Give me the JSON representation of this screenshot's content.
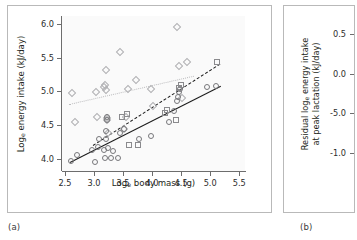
{
  "figure": {
    "panels": [
      {
        "id": "a",
        "caption": "(a)"
      },
      {
        "id": "b",
        "caption": "(b)"
      }
    ]
  },
  "chart_data": [
    {
      "type": "scatter",
      "panel": "(a)",
      "title": "",
      "xlabel_prefix": "Log",
      "xlabel_sub": "e",
      "xlabel_suffix": " body mass (g)",
      "xlabel": "Log_e body mass (g)",
      "ylabel_prefix": "Log",
      "ylabel_sub": "e",
      "ylabel_suffix": " energy intake (kJ/day)",
      "ylabel": "Log_e energy intake (kJ/day)",
      "xlim": [
        2.45,
        5.6
      ],
      "ylim": [
        3.82,
        6.12
      ],
      "xticks": [
        "2.5",
        "3.0",
        "3.5",
        "4.0",
        "4.5",
        "5.0",
        "5.5"
      ],
      "xtick_values": [
        2.5,
        3.0,
        3.5,
        4.0,
        4.5,
        5.0,
        5.5
      ],
      "yticks": [
        "6.0",
        "5.5",
        "5.0",
        "4.5",
        "4.0"
      ],
      "ytick_values": [
        6.0,
        5.5,
        5.0,
        4.5,
        4.0
      ],
      "grid": false,
      "legend": "none",
      "series": [
        {
          "name": "diamond-series",
          "marker": "diamond",
          "color": "#b0b0b3",
          "points": [
            [
              2.62,
              4.98
            ],
            [
              2.67,
              4.55
            ],
            [
              3.03,
              4.99
            ],
            [
              3.05,
              4.62
            ],
            [
              3.17,
              5.06
            ],
            [
              3.19,
              5.1
            ],
            [
              3.2,
              5.02
            ],
            [
              3.2,
              5.32
            ],
            [
              3.22,
              4.61
            ],
            [
              3.22,
              4.57
            ],
            [
              3.24,
              4.39
            ],
            [
              3.45,
              5.58
            ],
            [
              3.52,
              4.44
            ],
            [
              3.55,
              4.62
            ],
            [
              3.58,
              5.04
            ],
            [
              3.72,
              5.17
            ],
            [
              3.98,
              5.03
            ],
            [
              4.02,
              4.78
            ],
            [
              4.43,
              5.96
            ],
            [
              4.47,
              5.38
            ],
            [
              4.52,
              4.9
            ],
            [
              4.6,
              5.44
            ]
          ]
        },
        {
          "name": "circle-series",
          "marker": "circle",
          "color": "#77777a",
          "points": [
            [
              2.6,
              3.97
            ],
            [
              2.7,
              4.06
            ],
            [
              2.97,
              4.13
            ],
            [
              3.02,
              3.96
            ],
            [
              3.07,
              4.18
            ],
            [
              3.08,
              4.3
            ],
            [
              3.17,
              4.13
            ],
            [
              3.19,
              4.02
            ],
            [
              3.2,
              4.29
            ],
            [
              3.21,
              4.41
            ],
            [
              3.22,
              4.57
            ],
            [
              3.22,
              4.62
            ],
            [
              3.25,
              4.16
            ],
            [
              3.3,
              4.02
            ],
            [
              3.33,
              4.12
            ],
            [
              3.41,
              4.02
            ],
            [
              3.45,
              4.39
            ],
            [
              3.52,
              4.44
            ],
            [
              3.78,
              4.3
            ],
            [
              3.98,
              4.34
            ],
            [
              4.3,
              4.55
            ],
            [
              4.38,
              4.71
            ],
            [
              4.43,
              4.86
            ],
            [
              4.45,
              4.92
            ],
            [
              4.47,
              4.99
            ],
            [
              4.48,
              5.04
            ],
            [
              4.95,
              5.06
            ],
            [
              5.1,
              5.08
            ]
          ]
        },
        {
          "name": "square-series",
          "marker": "square",
          "color": "#8a8a8d",
          "points": [
            [
              3.48,
              4.62
            ],
            [
              3.57,
              4.66
            ],
            [
              3.6,
              4.21
            ],
            [
              3.75,
              4.2
            ],
            [
              4.22,
              4.68
            ],
            [
              4.25,
              4.72
            ],
            [
              4.42,
              4.58
            ],
            [
              4.47,
              5.05
            ],
            [
              4.5,
              5.09
            ],
            [
              5.12,
              5.44
            ]
          ]
        }
      ],
      "fits": [
        {
          "name": "solid-fit",
          "style": "solid",
          "color": "#1b1b1b",
          "x1": 2.58,
          "y1": 3.95,
          "x2": 5.17,
          "y2": 5.08
        },
        {
          "name": "dashed-fit",
          "style": "dashed",
          "color": "#1b1b1b",
          "x1": 2.98,
          "y1": 4.21,
          "x2": 5.17,
          "y2": 5.42
        },
        {
          "name": "dotted-fit",
          "style": "dotted",
          "color": "#bcbcbe",
          "x1": 2.57,
          "y1": 4.82,
          "x2": 4.72,
          "y2": 5.24
        }
      ]
    },
    {
      "type": "scatter",
      "panel": "(b)",
      "title": "",
      "ylabel_line1_prefix": "Residual log",
      "ylabel_line1_sub": "e",
      "ylabel_line1_suffix": " energy intake",
      "ylabel_line2": "at peak lactation (kJ/day)",
      "ylabel": "Residual log_e energy intake at peak lactation (kJ/day)",
      "yticks": [
        "0.5",
        "0.0",
        "-5.0",
        "-1.0"
      ],
      "ytick_values": [
        0.5,
        0.0,
        -0.5,
        -1.0
      ],
      "grid": false,
      "legend": "none",
      "series": []
    }
  ]
}
